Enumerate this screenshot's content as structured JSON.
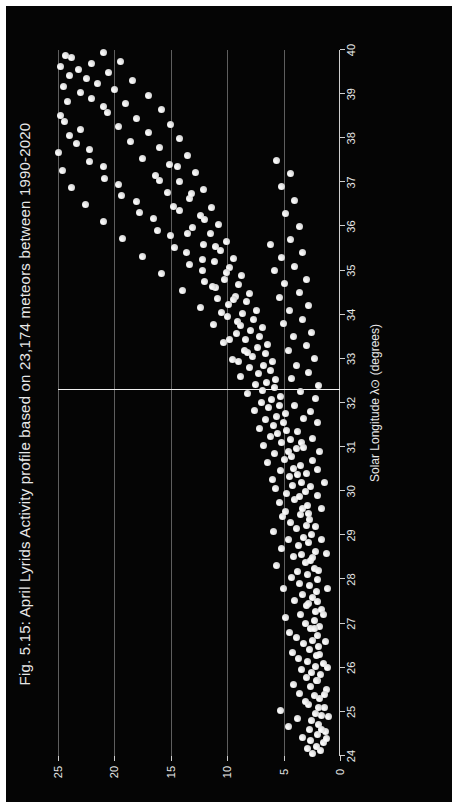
{
  "figure": {
    "background_color": "#050505",
    "page_background_color": "#ffffff",
    "point_color": "#e9e9e9",
    "grid_color": "#6f6f6f",
    "text_color": "#e8e8e8",
    "rotation_note": "chart rendered rotated 90 degrees counter-clockwise"
  },
  "chart_data": {
    "type": "scatter",
    "title": "Fig. 5.15: April Lyrids Activity profile based on 23,174 meteors between 1990-2020",
    "xlabel": "Solar Longitude λ⊙ (degrees)",
    "ylabel": "ZHR",
    "xlim": [
      24,
      40
    ],
    "ylim": [
      0,
      25
    ],
    "xticks": [
      24,
      25,
      26,
      27,
      28,
      29,
      30,
      31,
      32,
      33,
      34,
      35,
      36,
      37,
      38,
      39,
      40
    ],
    "xticklabels": [
      "24",
      "25",
      "26",
      "27",
      "28",
      "29",
      "30",
      "31",
      "32",
      "33",
      "34",
      "35",
      "36",
      "37",
      "38",
      "39",
      "40"
    ],
    "yticks": [
      0,
      5,
      10,
      15,
      20,
      25
    ],
    "yticklabels": [
      "0",
      "5",
      "10",
      "15",
      "20",
      "25"
    ],
    "grid": "vertical gridlines at ZHR 5, 10, 15, 20, 25",
    "legend": "none",
    "annotations": [
      {
        "name": "peak-line",
        "type": "vline-in-rotated-frame",
        "x": 32.3,
        "label": ""
      }
    ],
    "meteor_count": "23,174",
    "year_range": "1990-2020",
    "shower": "April Lyrids",
    "points": [
      [
        24.05,
        2.4
      ],
      [
        24.12,
        1.7
      ],
      [
        24.18,
        2.9
      ],
      [
        24.22,
        2.1
      ],
      [
        24.3,
        1.5
      ],
      [
        24.35,
        2.6
      ],
      [
        24.41,
        3.3
      ],
      [
        24.48,
        2.0
      ],
      [
        24.55,
        1.3
      ],
      [
        24.6,
        2.7
      ],
      [
        24.66,
        4.6
      ],
      [
        24.72,
        1.9
      ],
      [
        24.8,
        2.5
      ],
      [
        24.86,
        3.8
      ],
      [
        24.92,
        1.6
      ],
      [
        24.97,
        2.2
      ],
      [
        25.03,
        5.3
      ],
      [
        25.1,
        1.4
      ],
      [
        25.16,
        2.8
      ],
      [
        25.23,
        3.1
      ],
      [
        25.3,
        1.8
      ],
      [
        25.36,
        2.3
      ],
      [
        25.42,
        3.6
      ],
      [
        25.5,
        1.2
      ],
      [
        25.57,
        2.6
      ],
      [
        25.63,
        4.1
      ],
      [
        25.7,
        2.0
      ],
      [
        25.77,
        3.0
      ],
      [
        25.84,
        1.7
      ],
      [
        25.9,
        2.5
      ],
      [
        25.96,
        3.4
      ],
      [
        26.02,
        2.2
      ],
      [
        26.09,
        1.5
      ],
      [
        26.15,
        2.9
      ],
      [
        26.22,
        3.7
      ],
      [
        26.28,
        2.1
      ],
      [
        26.35,
        4.2
      ],
      [
        26.42,
        2.7
      ],
      [
        26.48,
        1.9
      ],
      [
        26.55,
        3.2
      ],
      [
        26.61,
        2.4
      ],
      [
        26.68,
        3.9
      ],
      [
        26.74,
        2.0
      ],
      [
        26.81,
        4.5
      ],
      [
        26.88,
        2.6
      ],
      [
        26.94,
        1.8
      ],
      [
        27.01,
        3.1
      ],
      [
        27.07,
        2.3
      ],
      [
        27.14,
        4.8
      ],
      [
        27.2,
        3.5
      ],
      [
        27.27,
        2.2
      ],
      [
        27.33,
        1.6
      ],
      [
        27.4,
        3.0
      ],
      [
        27.46,
        2.8
      ],
      [
        27.53,
        4.0
      ],
      [
        27.6,
        2.4
      ],
      [
        27.66,
        3.3
      ],
      [
        27.73,
        2.1
      ],
      [
        27.79,
        5.0
      ],
      [
        27.86,
        2.7
      ],
      [
        27.92,
        3.6
      ],
      [
        27.99,
        2.0
      ],
      [
        28.05,
        4.3
      ],
      [
        28.12,
        2.9
      ],
      [
        28.18,
        3.8
      ],
      [
        28.25,
        2.3
      ],
      [
        28.31,
        5.6
      ],
      [
        28.38,
        3.1
      ],
      [
        28.44,
        2.6
      ],
      [
        28.51,
        4.1
      ],
      [
        28.57,
        3.4
      ],
      [
        28.64,
        2.2
      ],
      [
        28.7,
        5.2
      ],
      [
        28.77,
        3.7
      ],
      [
        28.83,
        2.8
      ],
      [
        28.9,
        4.6
      ],
      [
        28.96,
        3.2
      ],
      [
        29.03,
        2.5
      ],
      [
        29.09,
        5.9
      ],
      [
        29.16,
        3.9
      ],
      [
        29.22,
        3.0
      ],
      [
        29.29,
        4.4
      ],
      [
        29.35,
        2.7
      ],
      [
        29.42,
        5.1
      ],
      [
        29.48,
        3.5
      ],
      [
        29.55,
        4.8
      ],
      [
        29.61,
        3.3
      ],
      [
        29.68,
        2.9
      ],
      [
        29.74,
        5.4
      ],
      [
        29.81,
        4.0
      ],
      [
        29.87,
        3.6
      ],
      [
        29.94,
        4.7
      ],
      [
        30.0,
        3.1
      ],
      [
        30.07,
        5.7
      ],
      [
        30.13,
        4.2
      ],
      [
        30.2,
        3.4
      ],
      [
        30.26,
        6.0
      ],
      [
        30.33,
        4.5
      ],
      [
        30.39,
        3.8
      ],
      [
        30.46,
        5.3
      ],
      [
        30.52,
        4.1
      ],
      [
        30.59,
        3.5
      ],
      [
        30.65,
        6.4
      ],
      [
        30.72,
        4.9
      ],
      [
        30.78,
        4.3
      ],
      [
        30.85,
        5.8
      ],
      [
        30.91,
        4.6
      ],
      [
        30.98,
        3.9
      ],
      [
        31.04,
        6.8
      ],
      [
        31.11,
        5.2
      ],
      [
        31.17,
        4.4
      ],
      [
        31.24,
        6.2
      ],
      [
        31.3,
        5.5
      ],
      [
        31.37,
        4.7
      ],
      [
        31.43,
        7.1
      ],
      [
        31.5,
        5.9
      ],
      [
        31.56,
        5.0
      ],
      [
        31.63,
        6.6
      ],
      [
        31.69,
        5.6
      ],
      [
        31.76,
        4.8
      ],
      [
        31.82,
        7.6
      ],
      [
        31.89,
        6.3
      ],
      [
        31.95,
        5.4
      ],
      [
        32.02,
        7.0
      ],
      [
        32.08,
        6.1
      ],
      [
        32.15,
        5.3
      ],
      [
        32.21,
        8.2
      ],
      [
        32.28,
        6.9
      ],
      [
        32.34,
        5.8
      ],
      [
        32.41,
        7.5
      ],
      [
        32.47,
        6.5
      ],
      [
        32.54,
        5.7
      ],
      [
        32.6,
        8.8
      ],
      [
        32.67,
        7.2
      ],
      [
        32.73,
        6.2
      ],
      [
        32.8,
        8.0
      ],
      [
        32.86,
        6.8
      ],
      [
        32.93,
        6.0
      ],
      [
        32.99,
        9.5
      ],
      [
        33.06,
        7.8
      ],
      [
        33.12,
        6.6
      ],
      [
        33.19,
        8.5
      ],
      [
        33.25,
        7.3
      ],
      [
        33.32,
        6.4
      ],
      [
        33.38,
        10.3
      ],
      [
        33.45,
        8.4
      ],
      [
        33.51,
        7.1
      ],
      [
        33.58,
        9.2
      ],
      [
        33.64,
        7.9
      ],
      [
        33.71,
        6.9
      ],
      [
        33.77,
        11.2
      ],
      [
        33.84,
        9.1
      ],
      [
        33.9,
        7.7
      ],
      [
        33.97,
        10.0
      ],
      [
        34.03,
        8.6
      ],
      [
        34.1,
        7.4
      ],
      [
        34.16,
        12.4
      ],
      [
        34.23,
        9.9
      ],
      [
        34.29,
        8.3
      ],
      [
        34.36,
        10.9
      ],
      [
        34.42,
        9.3
      ],
      [
        34.49,
        8.0
      ],
      [
        34.55,
        14.0
      ],
      [
        34.62,
        11.0
      ],
      [
        34.68,
        9.0
      ],
      [
        34.75,
        12.0
      ],
      [
        34.81,
        10.2
      ],
      [
        34.88,
        8.7
      ],
      [
        34.94,
        15.8
      ],
      [
        35.01,
        12.2
      ],
      [
        35.07,
        9.8
      ],
      [
        35.14,
        13.3
      ],
      [
        35.2,
        11.1
      ],
      [
        35.27,
        9.4
      ],
      [
        35.33,
        17.5
      ],
      [
        35.4,
        13.6
      ],
      [
        35.46,
        10.6
      ],
      [
        35.53,
        14.7
      ],
      [
        35.59,
        12.1
      ],
      [
        35.66,
        10.1
      ],
      [
        35.72,
        19.3
      ],
      [
        35.79,
        15.0
      ],
      [
        35.85,
        11.5
      ],
      [
        35.92,
        16.2
      ],
      [
        35.98,
        13.1
      ],
      [
        36.05,
        10.8
      ],
      [
        36.11,
        21.0
      ],
      [
        36.18,
        16.5
      ],
      [
        36.24,
        12.4
      ],
      [
        36.31,
        17.8
      ],
      [
        36.37,
        14.2
      ],
      [
        36.44,
        11.4
      ],
      [
        36.5,
        22.6
      ],
      [
        36.57,
        18.0
      ],
      [
        36.63,
        13.3
      ],
      [
        36.7,
        19.4
      ],
      [
        36.76,
        15.3
      ],
      [
        36.83,
        12.1
      ],
      [
        36.89,
        23.8
      ],
      [
        36.96,
        19.6
      ],
      [
        37.02,
        14.2
      ],
      [
        37.09,
        20.9
      ],
      [
        37.15,
        16.4
      ],
      [
        37.22,
        12.8
      ],
      [
        37.28,
        24.6
      ],
      [
        37.35,
        21.0
      ],
      [
        37.41,
        15.1
      ],
      [
        37.48,
        22.2
      ],
      [
        37.54,
        17.5
      ],
      [
        37.61,
        13.5
      ],
      [
        37.67,
        25.0
      ],
      [
        37.74,
        22.2
      ],
      [
        37.8,
        16.0
      ],
      [
        37.87,
        23.4
      ],
      [
        37.93,
        18.6
      ],
      [
        38.0,
        14.2
      ],
      [
        38.06,
        24.0
      ],
      [
        38.13,
        17.0
      ],
      [
        38.19,
        23.0
      ],
      [
        38.26,
        19.6
      ],
      [
        38.32,
        15.0
      ],
      [
        38.39,
        24.4
      ],
      [
        38.45,
        18.0
      ],
      [
        38.52,
        24.8
      ],
      [
        38.58,
        20.6
      ],
      [
        38.65,
        15.8
      ],
      [
        38.71,
        21.0
      ],
      [
        38.78,
        19.0
      ],
      [
        38.84,
        24.2
      ],
      [
        38.91,
        22.0
      ],
      [
        38.97,
        17.0
      ],
      [
        39.04,
        23.0
      ],
      [
        39.1,
        20.0
      ],
      [
        39.17,
        24.5
      ],
      [
        39.23,
        21.5
      ],
      [
        39.3,
        18.4
      ],
      [
        39.36,
        22.5
      ],
      [
        39.43,
        24.0
      ],
      [
        39.49,
        20.5
      ],
      [
        39.56,
        23.2
      ],
      [
        39.62,
        24.8
      ],
      [
        39.69,
        22.0
      ],
      [
        39.75,
        19.5
      ],
      [
        39.82,
        23.8
      ],
      [
        39.88,
        24.3
      ],
      [
        39.95,
        21.0
      ],
      [
        30.5,
        2.0
      ],
      [
        30.9,
        1.8
      ],
      [
        31.2,
        2.4
      ],
      [
        31.55,
        2.0
      ],
      [
        31.8,
        2.6
      ],
      [
        32.1,
        2.2
      ],
      [
        32.4,
        1.9
      ],
      [
        32.7,
        2.8
      ],
      [
        33.0,
        2.3
      ],
      [
        33.3,
        3.0
      ],
      [
        33.6,
        2.5
      ],
      [
        33.9,
        3.3
      ],
      [
        34.2,
        2.8
      ],
      [
        34.5,
        3.6
      ],
      [
        34.8,
        3.0
      ],
      [
        35.1,
        4.0
      ],
      [
        35.4,
        3.3
      ],
      [
        35.7,
        4.4
      ],
      [
        36.0,
        3.6
      ],
      [
        36.3,
        4.8
      ],
      [
        36.6,
        4.0
      ],
      [
        36.9,
        5.2
      ],
      [
        37.2,
        4.4
      ],
      [
        37.5,
        5.6
      ],
      [
        29.6,
        1.6
      ],
      [
        29.9,
        2.0
      ],
      [
        30.2,
        1.4
      ],
      [
        28.6,
        1.2
      ],
      [
        28.9,
        1.6
      ],
      [
        27.8,
        1.1
      ],
      [
        27.2,
        1.5
      ],
      [
        26.6,
        1.3
      ],
      [
        26.0,
        1.1
      ],
      [
        25.4,
        1.4
      ],
      [
        24.9,
        1.0
      ],
      [
        24.4,
        1.2
      ],
      [
        32.95,
        9.0
      ],
      [
        33.15,
        8.2
      ],
      [
        33.45,
        9.8
      ],
      [
        33.75,
        8.8
      ],
      [
        34.05,
        10.5
      ],
      [
        34.35,
        9.4
      ],
      [
        34.65,
        11.3
      ],
      [
        34.95,
        10.1
      ],
      [
        35.25,
        12.2
      ],
      [
        35.55,
        11.0
      ],
      [
        35.85,
        13.5
      ],
      [
        36.15,
        12.0
      ],
      [
        36.45,
        14.8
      ],
      [
        36.75,
        13.2
      ],
      [
        37.05,
        16.0
      ],
      [
        37.35,
        14.4
      ],
      [
        31.1,
        3.4
      ],
      [
        31.35,
        3.8
      ],
      [
        31.65,
        3.2
      ],
      [
        31.95,
        4.0
      ],
      [
        32.25,
        3.5
      ],
      [
        32.55,
        4.3
      ],
      [
        32.85,
        3.9
      ],
      [
        33.2,
        4.6
      ],
      [
        33.5,
        4.1
      ],
      [
        33.8,
        5.0
      ],
      [
        34.1,
        4.5
      ],
      [
        34.4,
        5.4
      ],
      [
        34.7,
        4.9
      ],
      [
        35.0,
        5.8
      ],
      [
        35.3,
        5.2
      ],
      [
        35.6,
        6.2
      ],
      [
        30.1,
        2.6
      ],
      [
        30.4,
        3.0
      ],
      [
        30.7,
        2.4
      ],
      [
        31.0,
        3.2
      ],
      [
        29.2,
        2.2
      ],
      [
        29.5,
        2.8
      ],
      [
        28.2,
        1.9
      ],
      [
        28.5,
        2.4
      ],
      [
        27.5,
        2.0
      ],
      [
        26.9,
        2.3
      ],
      [
        26.3,
        1.8
      ],
      [
        25.7,
        2.1
      ],
      [
        25.1,
        1.9
      ],
      [
        24.6,
        1.6
      ]
    ]
  }
}
